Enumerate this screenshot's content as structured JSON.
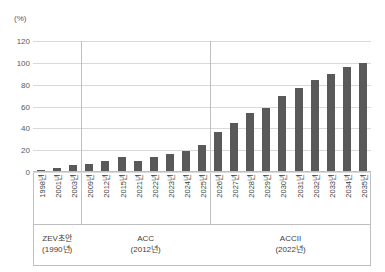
{
  "chart_data": {
    "type": "bar",
    "title": "",
    "subtitle": "",
    "unit_label": "(%)",
    "xlabel": "",
    "ylabel": "",
    "ylim": [
      0,
      120
    ],
    "yticks": [
      0,
      20,
      40,
      60,
      80,
      100,
      120
    ],
    "ytick_labels": [
      "0",
      "20",
      "40",
      "60",
      "80",
      "100",
      "120"
    ],
    "grid": true,
    "legend": "none",
    "bar_color": "#595959",
    "gridline_color": "#d9d9d9",
    "axis_color": "#bfbfbf",
    "categories": [
      "1998년",
      "2001년",
      "2003년",
      "2009년",
      "2012년",
      "2015년",
      "2021년",
      "2022년",
      "2023년",
      "2024년",
      "2025년",
      "2026년",
      "2027년",
      "2028년",
      "2029년",
      "2030년",
      "2031년",
      "2032년",
      "2033년",
      "2034년",
      "2035년"
    ],
    "values": [
      2,
      4,
      6,
      7.5,
      10,
      14,
      10,
      14,
      16.5,
      19.5,
      24.5,
      37,
      45,
      54,
      58.5,
      69.5,
      77,
      84.5,
      90,
      96,
      100
    ],
    "groups": [
      {
        "name": "ZEV초안",
        "year": "(1990년)",
        "span": 3
      },
      {
        "name": "ACC",
        "year": "(2012년)",
        "span": 8
      },
      {
        "name": "ACCII",
        "year": "(2022년)",
        "span": 10
      }
    ]
  }
}
